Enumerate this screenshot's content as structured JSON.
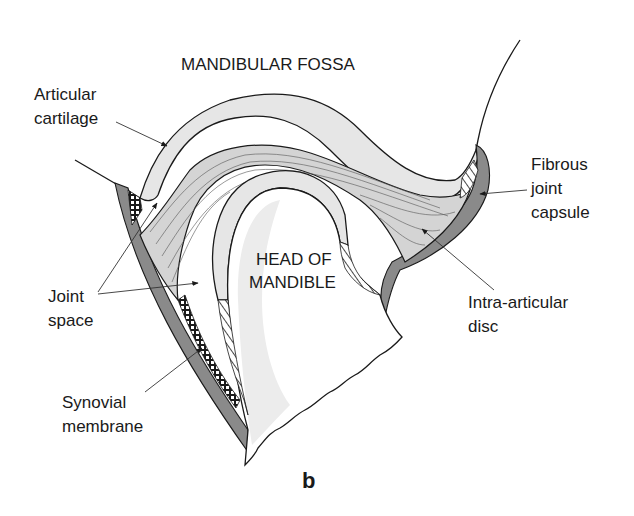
{
  "figure": {
    "panel_letter": "b"
  },
  "labels": {
    "mandibular_fossa": "MANDIBULAR FOSSA",
    "articular_cartilage_line1": "Articular",
    "articular_cartilage_line2": "cartilage",
    "fibrous_capsule_line1": "Fibrous",
    "fibrous_capsule_line2": "joint",
    "fibrous_capsule_line3": "capsule",
    "joint_space_line1": "Joint",
    "joint_space_line2": "space",
    "head_line1": "HEAD OF",
    "head_line2": "MANDIBLE",
    "intra_articular_line1": "Intra-articular",
    "intra_articular_line2": "disc",
    "synovial_line1": "Synovial",
    "synovial_line2": "membrane"
  },
  "colors": {
    "cartilage_fill": "#e6e6e6",
    "disc_fill": "#d4d4d4",
    "capsule_fill": "#8a8a8a",
    "bone_shade": "#ececec",
    "outline": "#1a1a1a",
    "background": "#ffffff"
  }
}
